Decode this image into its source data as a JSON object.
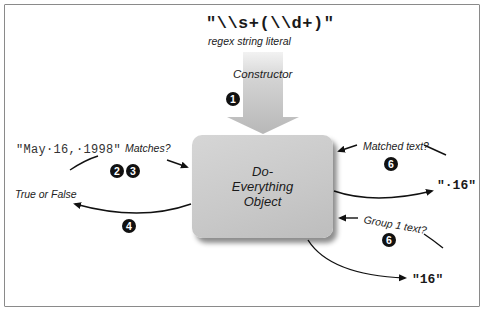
{
  "diagram": {
    "regex_literal": "\"\\\\s+(\\\\d+)\"",
    "regex_caption": "regex string literal",
    "constructor_label": "Constructor",
    "object_label": "Do-Everything Object",
    "object_lines": [
      "Do-",
      "Everything",
      "Object"
    ],
    "input_string": "\"May·16,·1998\"",
    "matches_label": "Matches?",
    "result_label": "True or False",
    "matched_text_label": "Matched text?",
    "matched_text_value": "\"·16\"",
    "group1_label": "Group 1 text?",
    "group1_value": "\"16\"",
    "steps": {
      "constructor": "1",
      "matches_a": "2",
      "matches_b": "3",
      "result": "4",
      "matched_text": "6",
      "group1": "6"
    },
    "colors": {
      "box_fill": "#c9c9c9",
      "arrow_fill": "#c4c4c4",
      "badge": "#111111",
      "frame": "#8a8a8a"
    }
  }
}
